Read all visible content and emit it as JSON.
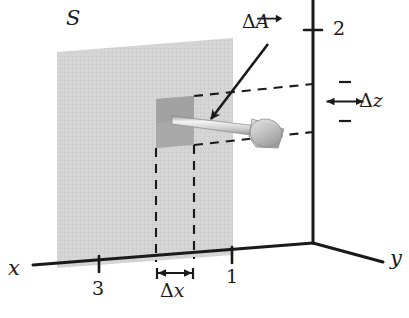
{
  "figure": {
    "name": "flux-through-surface-element-diagram",
    "surface_label": "S",
    "axes": {
      "x_label": "x",
      "y_label": "y",
      "z_label": ""
    },
    "ticks": {
      "x_far": "3",
      "x_near": "1",
      "z_top": "2"
    },
    "annotations": {
      "area_vector": "ΔA",
      "area_vector_delta": "Δ",
      "area_vector_symbol": "A",
      "delta_x": "Δx",
      "delta_x_delta": "Δ",
      "delta_x_symbol": "x",
      "delta_z": "Δz",
      "delta_z_delta": "Δ",
      "delta_z_symbol": "z"
    },
    "colors": {
      "ink": "#1a1a1a",
      "surface_fill": "#d2d2d2",
      "patch_fill": "#a8a8a8",
      "patch_fill_dark": "#9a9a9a",
      "arrow_shaft_light": "#f2f2f2",
      "arrow_shaft_dark": "#9d9d9d",
      "arrowhead": "#bdbdbd",
      "background": "#ffffff"
    }
  }
}
